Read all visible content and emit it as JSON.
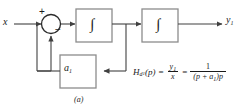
{
  "figure": {
    "caption": "(a)",
    "type": "block-diagram"
  },
  "signals": {
    "input_label": "x",
    "output_label": "y",
    "output_subscript": "1"
  },
  "summing_junction": {
    "name": "summing-junction",
    "plus_sign": "+",
    "minus_sign": "−"
  },
  "blocks": {
    "integrator_1": {
      "label": "∫"
    },
    "integrator_2": {
      "label": "∫"
    },
    "feedback_gain": {
      "label": "a",
      "subscript": "1"
    }
  },
  "formula": {
    "h_symbol": "H",
    "h_subscript": "d",
    "h_subsubscript": "1",
    "h_arg": "(p) ",
    "equals_1": "=",
    "frac1_num": "y",
    "frac1_num_sub": "1",
    "frac1_den": "x",
    "equals_2": "=",
    "frac2_num": "1",
    "frac2_den_open": "(p + a",
    "frac2_den_sub": "1",
    "frac2_den_close": ")p"
  },
  "colors": {
    "line": "#404040",
    "box_stroke": "#8c8c8c",
    "text": "#1a1a1a",
    "background": "#ffffff"
  }
}
